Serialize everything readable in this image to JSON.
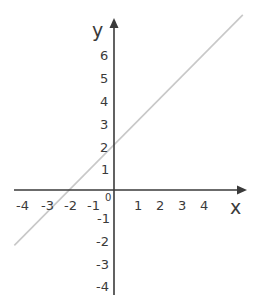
{
  "chart_data": {
    "type": "line",
    "title": "",
    "xlabel": "x",
    "ylabel": "y",
    "origin_label": "0",
    "xlim": [
      -4.5,
      5.8
    ],
    "ylim": [
      -4.6,
      7.5
    ],
    "grid": false,
    "legend": null,
    "x_ticks": [
      -4,
      -3,
      -2,
      -1,
      1,
      2,
      3,
      4
    ],
    "x_tick_labels": [
      "-4",
      "-3",
      "-2",
      "-1",
      "1",
      "2",
      "3",
      "4"
    ],
    "y_ticks": [
      6,
      5,
      4,
      3,
      2,
      1,
      -1,
      -2,
      -3,
      -4
    ],
    "y_tick_labels": [
      "6",
      "5",
      "4",
      "3",
      "2",
      "1",
      "-1",
      "-2",
      "-3",
      "-4"
    ],
    "series": [
      {
        "name": "y = x + 2",
        "equation": "y = x + 2",
        "slope": 1,
        "y_intercept": 2,
        "x_intercept": -2,
        "x": [
          -4.45,
          5.75
        ],
        "y": [
          -2.45,
          7.75
        ],
        "color": "#c8c8c8"
      }
    ]
  },
  "colors": {
    "axis": "#3a3a3a",
    "line": "#c8c8c8",
    "text": "#3a3a3a",
    "background": "#ffffff"
  }
}
